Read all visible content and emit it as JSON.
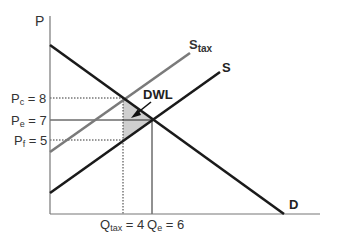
{
  "diagram": {
    "axes": {
      "y_label": "P",
      "x_label": ""
    },
    "curves": {
      "demand": {
        "label": "D",
        "color": "#1a1a1a"
      },
      "supply": {
        "label": "S",
        "color": "#1a1a1a"
      },
      "supply_tax": {
        "label_main": "S",
        "label_sub": "tax",
        "color": "#7a7a7a"
      }
    },
    "price_labels": {
      "pc": {
        "main": "P",
        "sub": "c",
        "value": " = 8"
      },
      "pe": {
        "main": "P",
        "sub": "e",
        "value": " = 7"
      },
      "pf": {
        "main": "P",
        "sub": "f",
        "value": " = 5"
      }
    },
    "quantity_labels": {
      "qtax": {
        "main": "Q",
        "sub": "tax",
        "value": " = 4"
      },
      "qe": {
        "main": "Q",
        "sub": "e",
        "value": " = 6"
      }
    },
    "annotation": {
      "dwl_label": "DWL",
      "dwl_fill": "#cfcfcf"
    }
  }
}
